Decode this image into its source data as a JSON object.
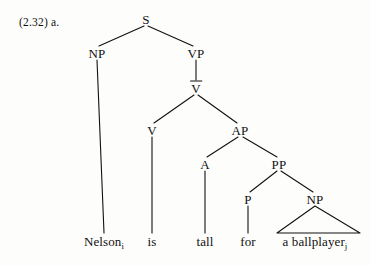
{
  "figure": {
    "example_number": "(2.32) a.",
    "caption_parts": {
      "number": "(2.32)",
      "letter": "a."
    }
  },
  "tree": {
    "type": "phrase-structure-tree",
    "sentence": "Nelson is tall for a ballplayer",
    "nodes": [
      {
        "id": "S",
        "label": "S",
        "bar": false,
        "x": 146,
        "y": 19
      },
      {
        "id": "NP1",
        "label": "NP",
        "bar": false,
        "x": 97,
        "y": 53
      },
      {
        "id": "VP",
        "label": "VP",
        "bar": false,
        "x": 196,
        "y": 53
      },
      {
        "id": "Vbar",
        "label": "V",
        "bar": true,
        "x": 196,
        "y": 88
      },
      {
        "id": "V",
        "label": "V",
        "bar": false,
        "x": 152,
        "y": 130
      },
      {
        "id": "AP",
        "label": "AP",
        "bar": false,
        "x": 240,
        "y": 130
      },
      {
        "id": "A",
        "label": "A",
        "bar": false,
        "x": 205,
        "y": 164
      },
      {
        "id": "PP",
        "label": "PP",
        "bar": false,
        "x": 279,
        "y": 164
      },
      {
        "id": "P",
        "label": "P",
        "bar": false,
        "x": 248,
        "y": 199
      },
      {
        "id": "NP2",
        "label": "NP",
        "bar": false,
        "x": 315,
        "y": 199
      }
    ],
    "terminals": [
      {
        "id": "t-nelson",
        "text": "Nelson",
        "subscript": "i",
        "x": 104,
        "y": 241,
        "parent": "NP1"
      },
      {
        "id": "t-is",
        "text": "is",
        "subscript": "",
        "x": 152,
        "y": 241,
        "parent": "V"
      },
      {
        "id": "t-tall",
        "text": "tall",
        "subscript": "",
        "x": 205,
        "y": 241,
        "parent": "A"
      },
      {
        "id": "t-for",
        "text": "for",
        "subscript": "",
        "x": 248,
        "y": 241,
        "parent": "P"
      },
      {
        "id": "t-ballplayer",
        "text": "a ballplayer",
        "subscript": "j",
        "x": 315,
        "y": 241,
        "parent": "NP2"
      }
    ],
    "triangles": [
      {
        "id": "tri-np2",
        "apex_x": 315,
        "apex_y": 206,
        "left_x": 277,
        "right_x": 360,
        "base_y": 233
      }
    ],
    "edges": [
      {
        "from": "S",
        "to": "NP1",
        "x1": 144,
        "y1": 26,
        "x2": 99,
        "y2": 46
      },
      {
        "from": "S",
        "to": "VP",
        "x1": 148,
        "y1": 26,
        "x2": 193,
        "y2": 46
      },
      {
        "from": "NP1",
        "to": "t-nelson",
        "x1": 97,
        "y1": 60,
        "x2": 104,
        "y2": 233
      },
      {
        "from": "VP",
        "to": "Vbar",
        "x1": 196,
        "y1": 60,
        "x2": 196,
        "y2": 80
      },
      {
        "from": "Vbar",
        "to": "V",
        "x1": 194,
        "y1": 95,
        "x2": 154,
        "y2": 123
      },
      {
        "from": "Vbar",
        "to": "AP",
        "x1": 198,
        "y1": 95,
        "x2": 237,
        "y2": 123
      },
      {
        "from": "V",
        "to": "t-is",
        "x1": 152,
        "y1": 137,
        "x2": 152,
        "y2": 233
      },
      {
        "from": "AP",
        "to": "A",
        "x1": 238,
        "y1": 137,
        "x2": 207,
        "y2": 157
      },
      {
        "from": "AP",
        "to": "PP",
        "x1": 243,
        "y1": 137,
        "x2": 277,
        "y2": 157
      },
      {
        "from": "A",
        "to": "t-tall",
        "x1": 205,
        "y1": 171,
        "x2": 205,
        "y2": 233
      },
      {
        "from": "PP",
        "to": "P",
        "x1": 277,
        "y1": 171,
        "x2": 250,
        "y2": 192
      },
      {
        "from": "PP",
        "to": "NP2",
        "x1": 281,
        "y1": 171,
        "x2": 313,
        "y2": 192
      },
      {
        "from": "P",
        "to": "t-for",
        "x1": 248,
        "y1": 206,
        "x2": 248,
        "y2": 233
      }
    ]
  },
  "style": {
    "ink_color": "#111111",
    "background_color": "#fdfdfc",
    "line_width": 1.1
  }
}
